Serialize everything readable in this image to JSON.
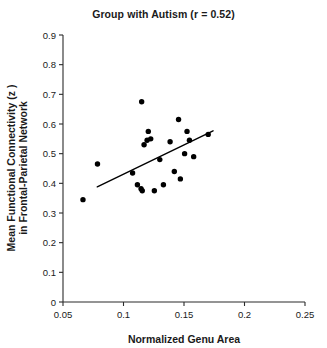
{
  "chart_data": {
    "type": "scatter",
    "title": "Group with Autism (r = 0.52)",
    "xlabel": "Normalized Genu Area",
    "ylabel_line1": "Mean Functional Connectivity (z )",
    "ylabel_line2": "in Frontal-Parietal Network",
    "correlation_r": 0.52,
    "xlim": [
      0.05,
      0.25
    ],
    "ylim": [
      0,
      0.9
    ],
    "xticks": [
      0.05,
      0.1,
      0.15,
      0.2,
      0.25
    ],
    "xtick_labels": [
      "0.05",
      "0.1",
      "0.15",
      "0.2",
      "0.25"
    ],
    "yticks": [
      0,
      0.1,
      0.2,
      0.3,
      0.4,
      0.5,
      0.6,
      0.7,
      0.8,
      0.9
    ],
    "ytick_labels": [
      "0",
      "0.1",
      "0.2",
      "0.3",
      "0.4",
      "0.5",
      "0.6",
      "0.7",
      "0.8",
      "0.9"
    ],
    "grid": false,
    "legend": false,
    "marker": "filled-circle",
    "marker_color": "#000000",
    "marker_size_px": 5,
    "points": [
      {
        "x": 0.0665,
        "y": 0.345
      },
      {
        "x": 0.0785,
        "y": 0.465
      },
      {
        "x": 0.1075,
        "y": 0.435
      },
      {
        "x": 0.1115,
        "y": 0.395
      },
      {
        "x": 0.1145,
        "y": 0.382
      },
      {
        "x": 0.1155,
        "y": 0.375
      },
      {
        "x": 0.115,
        "y": 0.675
      },
      {
        "x": 0.117,
        "y": 0.53
      },
      {
        "x": 0.1195,
        "y": 0.545
      },
      {
        "x": 0.1205,
        "y": 0.575
      },
      {
        "x": 0.1225,
        "y": 0.55
      },
      {
        "x": 0.1255,
        "y": 0.375
      },
      {
        "x": 0.13,
        "y": 0.48
      },
      {
        "x": 0.133,
        "y": 0.395
      },
      {
        "x": 0.1385,
        "y": 0.54
      },
      {
        "x": 0.142,
        "y": 0.44
      },
      {
        "x": 0.1455,
        "y": 0.615
      },
      {
        "x": 0.147,
        "y": 0.415
      },
      {
        "x": 0.1505,
        "y": 0.5
      },
      {
        "x": 0.1525,
        "y": 0.575
      },
      {
        "x": 0.1545,
        "y": 0.545
      },
      {
        "x": 0.158,
        "y": 0.49
      },
      {
        "x": 0.17,
        "y": 0.565
      }
    ],
    "fit_line": {
      "x_start": 0.0783,
      "y_start": 0.388,
      "x_end": 0.174,
      "y_end": 0.577
    }
  }
}
